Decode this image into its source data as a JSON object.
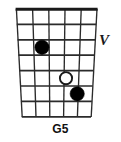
{
  "diagram": {
    "type": "guitar-chord-diagram",
    "chord_name": "G5",
    "position_marker": "V",
    "position_marker_meaning": "5th fret position",
    "instrument": "guitar",
    "string_count": 6,
    "fret_count": 7,
    "nut_shown": true,
    "colors": {
      "background": "#ffffff",
      "grid_line": "#2b2b2b",
      "nut": "#1a1a1a",
      "filled_dot_fill": "#000000",
      "filled_dot_stroke": "#000000",
      "open_dot_fill": "#ffffff",
      "open_dot_stroke": "#1a1a1a",
      "text": "#111111"
    },
    "geometry": {
      "top_left_x": 16,
      "top_right_x": 97,
      "bottom_left_x": 22,
      "bottom_right_x": 91,
      "top_y": 9,
      "bottom_y": 117,
      "fret_y_lines": [
        9,
        24,
        40,
        55,
        71,
        86,
        101,
        117
      ]
    },
    "markers": [
      {
        "label": "root-dot",
        "style": "filled",
        "string": 2,
        "fret_row": 3,
        "cx": 42,
        "cy": 47,
        "r": 7
      },
      {
        "label": "open-dot",
        "style": "open",
        "string": 4,
        "fret_row": 5,
        "cx": 66,
        "cy": 78,
        "r": 6
      },
      {
        "label": "fifth-dot",
        "style": "filled",
        "string": 5,
        "fret_row": 6,
        "cx": 77,
        "cy": 94,
        "r": 7
      }
    ]
  }
}
